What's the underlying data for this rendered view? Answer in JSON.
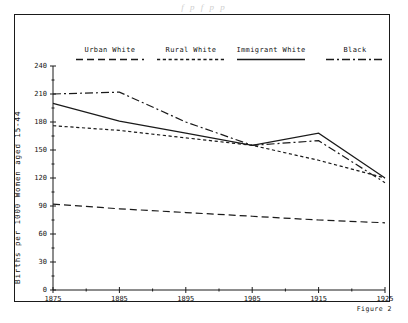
{
  "page": {
    "bleed_text": "f p f p p",
    "figure_caption": "Figure 2"
  },
  "legend": {
    "items": [
      {
        "label": "Urban White",
        "style": "long-dash",
        "x": 60,
        "y": 32,
        "w": 72
      },
      {
        "label": "Rural White",
        "style": "fine-dash",
        "x": 141,
        "y": 32,
        "w": 72
      },
      {
        "label": "Immigrant White",
        "style": "solid",
        "x": 221,
        "y": 32,
        "w": 72
      },
      {
        "label": "Black",
        "style": "dash-dot",
        "x": 310,
        "y": 32,
        "w": 62
      }
    ]
  },
  "axes": {
    "ylabel": "Births per 1000 Women aged 15-44",
    "yticks": [
      0,
      30,
      60,
      90,
      120,
      150,
      180,
      210,
      240
    ],
    "xticks": [
      1875,
      1885,
      1895,
      1905,
      1915,
      1925
    ]
  },
  "chart_data": {
    "type": "line",
    "title": "",
    "xlabel": "",
    "ylabel": "Births per 1000 Women aged 15-44",
    "xlim": [
      1875,
      1925
    ],
    "ylim": [
      0,
      240
    ],
    "grid": false,
    "legend_position": "top",
    "x": [
      1875,
      1885,
      1895,
      1905,
      1915,
      1925
    ],
    "series": [
      {
        "name": "Urban White",
        "style": "long-dash",
        "values": [
          92,
          87,
          83,
          79,
          75,
          72
        ]
      },
      {
        "name": "Rural White",
        "style": "fine-dash",
        "values": [
          176,
          171,
          163,
          155,
          139,
          120
        ]
      },
      {
        "name": "Immigrant White",
        "style": "solid",
        "values": [
          200,
          181,
          168,
          155,
          168,
          120
        ]
      },
      {
        "name": "Black",
        "style": "dash-dot",
        "values": [
          210,
          212,
          180,
          155,
          160,
          115
        ]
      }
    ]
  }
}
